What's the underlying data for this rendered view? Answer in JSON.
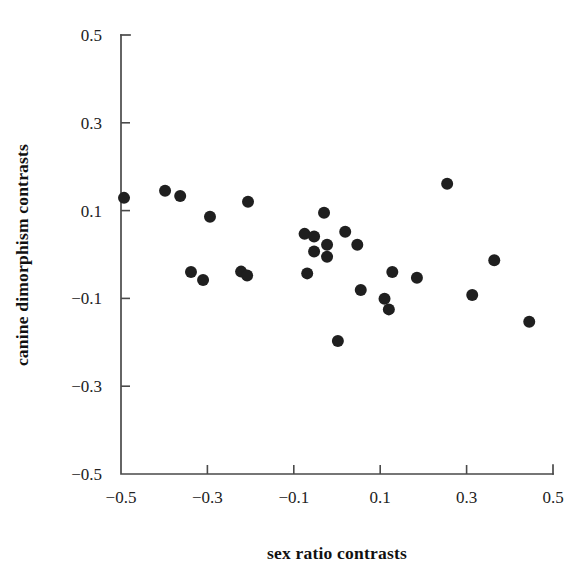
{
  "chart_data": {
    "type": "scatter",
    "title": "",
    "xlabel": "sex ratio contrasts",
    "ylabel": "canine dimorphism contrasts",
    "xlim": [
      -0.5,
      0.5
    ],
    "ylim": [
      -0.5,
      0.5
    ],
    "grid": false,
    "legend": null,
    "xticks": [
      -0.5,
      -0.3,
      -0.1,
      0.1,
      0.3,
      0.5
    ],
    "yticks": [
      -0.5,
      -0.3,
      -0.1,
      0.1,
      0.3,
      0.5
    ],
    "xtick_labels": [
      "−0.5",
      "−0.3",
      "−0.1",
      "0.1",
      "0.3",
      "0.5"
    ],
    "ytick_labels": [
      "−0.5",
      "−0.3",
      "−0.1",
      "0.1",
      "0.3",
      "0.5"
    ],
    "marker": "filled-circle",
    "marker_color": "#1f1f1f",
    "marker_size": 12,
    "points": [
      {
        "x": -0.493,
        "y": 0.129
      },
      {
        "x": -0.398,
        "y": 0.145
      },
      {
        "x": -0.363,
        "y": 0.133
      },
      {
        "x": -0.294,
        "y": 0.086
      },
      {
        "x": -0.206,
        "y": 0.12
      },
      {
        "x": -0.338,
        "y": -0.04
      },
      {
        "x": -0.31,
        "y": -0.058
      },
      {
        "x": -0.222,
        "y": -0.039
      },
      {
        "x": -0.208,
        "y": -0.048
      },
      {
        "x": -0.03,
        "y": 0.095
      },
      {
        "x": -0.075,
        "y": 0.047
      },
      {
        "x": -0.053,
        "y": 0.041
      },
      {
        "x": -0.053,
        "y": 0.007
      },
      {
        "x": 0.019,
        "y": 0.052
      },
      {
        "x": -0.023,
        "y": 0.022
      },
      {
        "x": -0.023,
        "y": -0.005
      },
      {
        "x": 0.047,
        "y": 0.022
      },
      {
        "x": -0.069,
        "y": -0.043
      },
      {
        "x": 0.055,
        "y": -0.081
      },
      {
        "x": 0.128,
        "y": -0.04
      },
      {
        "x": 0.185,
        "y": -0.053
      },
      {
        "x": 0.11,
        "y": -0.101
      },
      {
        "x": 0.12,
        "y": -0.125
      },
      {
        "x": 0.255,
        "y": 0.161
      },
      {
        "x": 0.364,
        "y": -0.013
      },
      {
        "x": 0.313,
        "y": -0.092
      },
      {
        "x": 0.445,
        "y": -0.153
      },
      {
        "x": 0.002,
        "y": -0.197
      }
    ]
  }
}
